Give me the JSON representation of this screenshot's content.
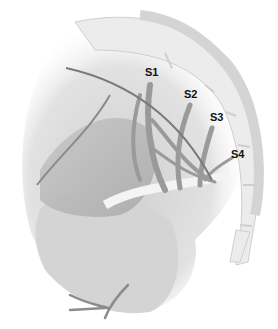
{
  "figure": {
    "type": "anatomical-illustration",
    "labels": [
      {
        "id": "s1",
        "text": "S1",
        "x": 145,
        "y": 73
      },
      {
        "id": "s2",
        "text": "S2",
        "x": 184,
        "y": 91
      },
      {
        "id": "s3",
        "text": "S3",
        "x": 211,
        "y": 113
      },
      {
        "id": "s4",
        "text": "S4",
        "x": 231,
        "y": 150
      }
    ],
    "colors": {
      "background": "#ffffff",
      "bone": "#ececec",
      "bone_edge": "#cfcfcf",
      "tissue": "#d8d8d8",
      "muscle": "#b4b4b4",
      "nerve": "#9a9a9a",
      "lead": "#7a7a7a",
      "label": "#111111"
    }
  }
}
